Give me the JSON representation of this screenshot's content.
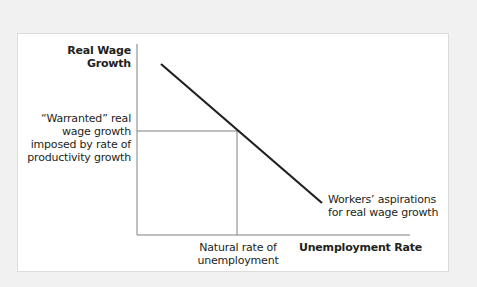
{
  "diagram": {
    "y_axis_label": [
      "Real Wage",
      "Growth"
    ],
    "x_axis_label": "Unemployment Rate",
    "warranted_label": [
      "“Warranted” real",
      "wage growth",
      "imposed by rate of",
      "productivity growth"
    ],
    "natural_rate_label": [
      "Natural rate of",
      "unemployment"
    ],
    "curve_label": [
      "Workers’ aspirations",
      "for real wage growth"
    ],
    "colors": {
      "background": "#f1f1f1",
      "panel": "#ffffff",
      "axis": "#808080",
      "curve": "#231f20",
      "text": "#231f20"
    }
  }
}
